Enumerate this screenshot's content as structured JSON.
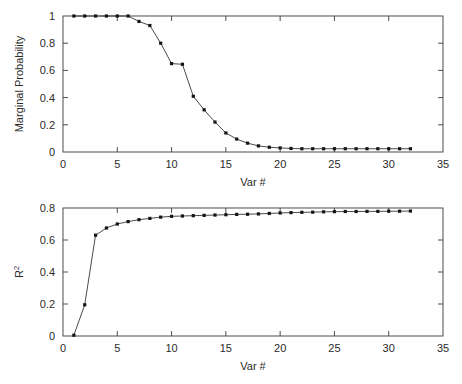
{
  "figure": {
    "background": "#ffffff",
    "line_color": "#2a2a2a",
    "marker_color": "#151515",
    "axis_color": "#3a3a3a"
  },
  "chart_data": [
    {
      "type": "line",
      "panel": "top",
      "title": "",
      "xlabel": "Var #",
      "ylabel": "Marginal Probability",
      "xlim": [
        0,
        35
      ],
      "ylim": [
        0,
        1
      ],
      "xticks": [
        0,
        5,
        10,
        15,
        20,
        25,
        30,
        35
      ],
      "xticklabels": [
        "0",
        "5",
        "10",
        "15",
        "20",
        "25",
        "30",
        "35"
      ],
      "yticks": [
        0,
        0.2,
        0.4,
        0.6,
        0.8,
        1
      ],
      "yticklabels": [
        "0",
        "0.2",
        "0.4",
        "0.6",
        "0.8",
        "1"
      ],
      "grid": false,
      "legend": null,
      "markers": "filled-square",
      "x": [
        1,
        2,
        3,
        4,
        5,
        6,
        7,
        8,
        9,
        10,
        11,
        12,
        13,
        14,
        15,
        16,
        17,
        18,
        19,
        20,
        21,
        22,
        23,
        24,
        25,
        26,
        27,
        28,
        29,
        30,
        31,
        32
      ],
      "values": [
        1.0,
        1.0,
        1.0,
        1.0,
        1.0,
        1.0,
        0.96,
        0.93,
        0.8,
        0.65,
        0.645,
        0.41,
        0.31,
        0.22,
        0.14,
        0.095,
        0.065,
        0.045,
        0.035,
        0.03,
        0.026,
        0.024,
        0.024,
        0.024,
        0.024,
        0.024,
        0.024,
        0.024,
        0.024,
        0.024,
        0.024,
        0.024
      ]
    },
    {
      "type": "line",
      "panel": "bottom",
      "title": "",
      "xlabel": "Var #",
      "ylabel": "R2",
      "ylabel_base": "R",
      "ylabel_sup": "2",
      "xlim": [
        0,
        35
      ],
      "ylim": [
        0,
        0.8
      ],
      "xticks": [
        0,
        5,
        10,
        15,
        20,
        25,
        30,
        35
      ],
      "xticklabels": [
        "0",
        "5",
        "10",
        "15",
        "20",
        "25",
        "30",
        "35"
      ],
      "yticks": [
        0,
        0.2,
        0.4,
        0.6,
        0.8
      ],
      "yticklabels": [
        "0",
        "0.2",
        "0.4",
        "0.6",
        "0.8"
      ],
      "grid": false,
      "legend": null,
      "markers": "filled-square",
      "x": [
        1,
        2,
        3,
        4,
        5,
        6,
        7,
        8,
        9,
        10,
        11,
        12,
        13,
        14,
        15,
        16,
        17,
        18,
        19,
        20,
        21,
        22,
        23,
        24,
        25,
        26,
        27,
        28,
        29,
        30,
        31,
        32
      ],
      "values": [
        0.005,
        0.195,
        0.63,
        0.675,
        0.7,
        0.715,
        0.727,
        0.735,
        0.743,
        0.748,
        0.75,
        0.752,
        0.754,
        0.756,
        0.758,
        0.76,
        0.761,
        0.763,
        0.766,
        0.769,
        0.771,
        0.773,
        0.774,
        0.776,
        0.777,
        0.778,
        0.778,
        0.779,
        0.779,
        0.78,
        0.78,
        0.781
      ]
    }
  ]
}
